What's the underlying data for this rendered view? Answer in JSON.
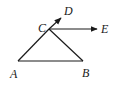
{
  "diagram": {
    "type": "geometry",
    "points": {
      "A": {
        "label": "A",
        "x": 18,
        "y": 61
      },
      "B": {
        "label": "B",
        "x": 83,
        "y": 61
      },
      "C": {
        "label": "C",
        "x": 49,
        "y": 29
      },
      "D": {
        "label": "D",
        "x": 61,
        "y": 18
      },
      "E": {
        "label": "E",
        "x": 98,
        "y": 29
      }
    },
    "segments": [
      {
        "from": "A",
        "to": "B"
      },
      {
        "from": "A",
        "to": "C"
      },
      {
        "from": "B",
        "to": "C"
      }
    ],
    "rays": [
      {
        "from": "C",
        "to": "D"
      },
      {
        "from": "C",
        "to": "E"
      }
    ],
    "labels": {
      "A": "A",
      "B": "B",
      "C": "C",
      "D": "D",
      "E": "E"
    },
    "colors": {
      "stroke": "#1a1a1a",
      "background": "#ffffff"
    }
  }
}
